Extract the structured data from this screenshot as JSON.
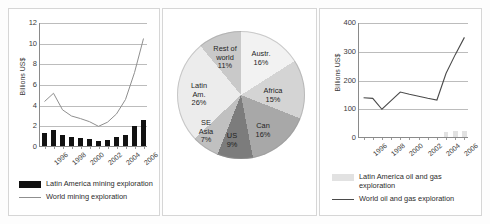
{
  "figure": {
    "panels": [
      "mining-exploration",
      "latin-america-share",
      "oil-gas-exploration"
    ]
  },
  "chart_data": [
    {
      "id": "left",
      "type": "bar",
      "title": "",
      "xlabel": "",
      "ylabel": "Billions US$",
      "ylim": [
        0,
        12
      ],
      "yticks": [
        0,
        2,
        4,
        6,
        8,
        10,
        12
      ],
      "grid": true,
      "legend_position": "bottom",
      "categories": [
        "1996",
        "1997",
        "1998",
        "1999",
        "2000",
        "2001",
        "2002",
        "2003",
        "2004",
        "2005",
        "2006",
        "2007"
      ],
      "tick_labels": [
        "1996",
        "1998",
        "2000",
        "2002",
        "2004",
        "2006"
      ],
      "series": [
        {
          "name": "Latin America mining exploration",
          "type": "bar",
          "color": "#111111",
          "values": [
            1.25,
            1.55,
            1.05,
            0.85,
            0.8,
            0.65,
            0.5,
            0.55,
            0.85,
            1.1,
            1.9,
            2.55
          ]
        },
        {
          "name": "World mining exploration",
          "type": "line",
          "color": "#8f8f8f",
          "values": [
            4.4,
            5.2,
            3.6,
            3.0,
            2.75,
            2.45,
            2.0,
            2.4,
            3.2,
            4.6,
            7.2,
            10.5
          ]
        }
      ]
    },
    {
      "id": "middle",
      "type": "pie",
      "title": "",
      "labels": [
        "Austr.",
        "Africa",
        "Can",
        "US",
        "SE Asia",
        "Latin Am.",
        "Rest of world"
      ],
      "values": [
        16,
        15,
        16,
        9,
        7,
        26,
        11
      ],
      "units": "%",
      "colors": [
        "#f2f2f2",
        "#d4d4d4",
        "#a8a8a8",
        "#7c7c7c",
        "#c0c0c0",
        "#ececec",
        "#c9c9c9"
      ],
      "slice_text": [
        {
          "label": "Austr.",
          "pct": "16%"
        },
        {
          "label": "Africa",
          "pct": "15%"
        },
        {
          "label": "Can",
          "pct": "16%"
        },
        {
          "label": "US",
          "pct": "9%"
        },
        {
          "label": "SE Asia",
          "pct": "7%"
        },
        {
          "label": "Latin Am.",
          "pct": "26%"
        },
        {
          "label": "Rest of world",
          "pct": "11%"
        }
      ]
    },
    {
      "id": "right",
      "type": "bar",
      "title": "",
      "xlabel": "",
      "ylabel": "Billions US$",
      "ylim": [
        0,
        400
      ],
      "yticks": [
        0,
        100,
        200,
        300,
        400
      ],
      "grid": true,
      "legend_position": "bottom",
      "categories": [
        "1996",
        "1997",
        "1998",
        "1999",
        "2000",
        "2001",
        "2002",
        "2003",
        "2004",
        "2005",
        "2006",
        "2007"
      ],
      "tick_labels": [
        "1996",
        "1998",
        "2000",
        "2002",
        "2004",
        "2006"
      ],
      "series": [
        {
          "name": "Latin America oil and gas exploration",
          "type": "bar",
          "color": "#e2e2e2",
          "values": [
            0,
            0,
            0,
            0,
            0,
            0,
            0,
            0,
            0,
            16,
            22,
            20
          ]
        },
        {
          "name": "World oil and gas exploration",
          "type": "line",
          "color": "#4a4a4a",
          "values": [
            140,
            138,
            100,
            130,
            160,
            152,
            145,
            138,
            132,
            225,
            290,
            350
          ]
        }
      ]
    }
  ],
  "left_chart": {
    "ylabel": "Billions US$",
    "yticks": [
      "0",
      "2",
      "4",
      "6",
      "8",
      "10",
      "12"
    ],
    "xticks": [
      "1996",
      "1998",
      "2000",
      "2002",
      "2004",
      "2006"
    ],
    "legend": [
      {
        "marker": "bar",
        "label": "Latin America mining exploration"
      },
      {
        "marker": "line",
        "label": "World mining exploration"
      }
    ]
  },
  "pie_chart": {
    "slices": [
      {
        "label": "Austr.",
        "pct": "16%"
      },
      {
        "label": "Africa",
        "pct": "15%"
      },
      {
        "label": "Can",
        "pct": "16%"
      },
      {
        "label": "US",
        "pct": "9%"
      },
      {
        "label": "SE Asia",
        "pct": "7%"
      },
      {
        "label": "Latin Am.",
        "pct": "26%"
      },
      {
        "label": "Rest of world",
        "pct": "11%"
      }
    ],
    "rest_line1": "Rest of",
    "rest_line2": "world",
    "rest_pct": "11%",
    "latin_line1": "Latin",
    "latin_line2": "Am.",
    "latin_pct": "26%",
    "seasia_line1": "SE",
    "seasia_line2": "Asia",
    "seasia_pct": "7%",
    "us_label": "US",
    "us_pct": "9%",
    "can_label": "Can",
    "can_pct": "16%",
    "africa_label": "Africa",
    "africa_pct": "15%",
    "austr_label": "Austr.",
    "austr_pct": "16%"
  },
  "right_chart": {
    "ylabel": "Billions US$",
    "yticks": [
      "0",
      "100",
      "200",
      "300",
      "400"
    ],
    "xticks": [
      "1996",
      "1998",
      "2000",
      "2002",
      "2004",
      "2006"
    ],
    "legend": [
      {
        "marker": "bar",
        "label_line1": "Latin America oil and gas",
        "label_line2": "exploration"
      },
      {
        "marker": "line",
        "label": "World oil and gas exploration"
      }
    ],
    "legend_bar_line1": "Latin America oil and gas",
    "legend_bar_line2": "exploration",
    "legend_line_label": "World oil and gas exploration"
  }
}
